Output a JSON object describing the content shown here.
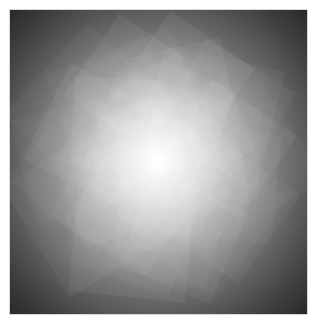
{
  "artwork": {
    "description": "Abstract grayscale radial burst of overlapping rotated polygons",
    "center": {
      "x": 148,
      "y": 150
    },
    "colors": {
      "background": "#ffffff",
      "edge": "#2a2a2a",
      "mid": "#7a7a7a",
      "center": "#ffffff"
    }
  }
}
